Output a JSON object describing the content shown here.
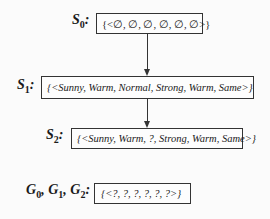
{
  "nodes": [
    {
      "id": "S0",
      "label_main": "S",
      "label_sub": "0",
      "hypothesis": "{<∅, ∅, ∅, ∅, ∅, ∅>}"
    },
    {
      "id": "S1",
      "label_main": "S",
      "label_sub": "1",
      "hypothesis": "{<Sunny, Warm, Normal, Strong, Warm, Same>}"
    },
    {
      "id": "S2",
      "label_main": "S",
      "label_sub": "2",
      "hypothesis": "{<Sunny, Warm, ?, Strong, Warm, Same>}"
    },
    {
      "id": "G",
      "labels": [
        {
          "main": "G",
          "sub": "0"
        },
        {
          "main": "G",
          "sub": "1"
        },
        {
          "main": "G",
          "sub": "2"
        }
      ],
      "hypothesis": "{<?, ?, ?, ?, ?, ?>}"
    }
  ],
  "edges": [
    {
      "from": "S0",
      "to": "S1"
    },
    {
      "from": "S1",
      "to": "S2"
    }
  ],
  "punct": {
    "colon": ":",
    "comma": ", "
  }
}
